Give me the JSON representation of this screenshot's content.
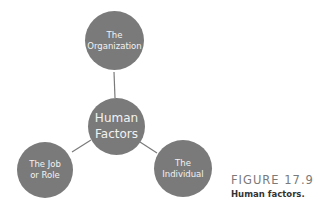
{
  "diagram": {
    "type": "hub-and-spoke",
    "colors": {
      "node_fill": "#7a7a7a",
      "node_text": "#f2f2f2",
      "connector": "#7a7a7a"
    },
    "center": {
      "line1": "Human",
      "line2": "Factors"
    },
    "nodes": [
      {
        "id": "organization",
        "line1": "The",
        "line2": "Organization"
      },
      {
        "id": "job-role",
        "line1": "The Job",
        "line2": "or Role"
      },
      {
        "id": "individual",
        "line1": "The",
        "line2": "Individual"
      }
    ],
    "edges": [
      {
        "from": "center",
        "to": "organization"
      },
      {
        "from": "center",
        "to": "job-role"
      },
      {
        "from": "center",
        "to": "individual"
      }
    ]
  },
  "caption": {
    "figure_label": "FIGURE 17.9",
    "title": "Human factors."
  }
}
